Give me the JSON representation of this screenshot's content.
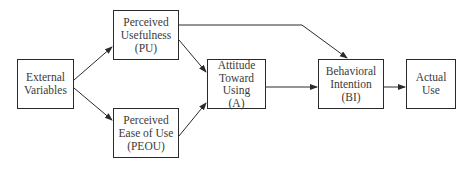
{
  "diagram": {
    "nodes": [
      {
        "id": "ext",
        "label": "External\nVariables"
      },
      {
        "id": "pu",
        "label": "Perceived\nUsefulness\n(PU)"
      },
      {
        "id": "peou",
        "label": "Perceived\nEase of Use\n(PEOU)"
      },
      {
        "id": "att",
        "label": "Attitude\nToward\nUsing\n(A)"
      },
      {
        "id": "bi",
        "label": "Behavioral\nIntention\n(BI)"
      },
      {
        "id": "use",
        "label": "Actual\nUse"
      }
    ],
    "edges": [
      {
        "from": "ext",
        "to": "pu"
      },
      {
        "from": "ext",
        "to": "peou"
      },
      {
        "from": "pu",
        "to": "att"
      },
      {
        "from": "peou",
        "to": "att"
      },
      {
        "from": "pu",
        "to": "bi"
      },
      {
        "from": "att",
        "to": "bi"
      },
      {
        "from": "bi",
        "to": "use"
      }
    ],
    "colors": {
      "line": "#2a2a2a",
      "text": "#3a3a3a",
      "background": "#ffffff"
    }
  }
}
